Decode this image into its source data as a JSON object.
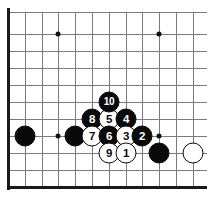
{
  "diagram": {
    "kind": "go-board-diagram",
    "caption": "",
    "board": {
      "edge_sides": [
        "left",
        "bottom"
      ],
      "columns": 12,
      "rows": 11,
      "line_color": "#7a7a7a",
      "edge_color": "#1a1a1a",
      "background_color": "#ffffff",
      "spacing_px": 16.8,
      "origin_x_px": 8,
      "origin_y_px": 12,
      "vertical_lines_x": [
        8,
        25,
        42,
        58,
        75,
        92,
        109,
        126,
        142,
        159,
        176,
        193
      ],
      "horizontal_lines_y": [
        12,
        34,
        51,
        68,
        85,
        102,
        119,
        136,
        153,
        170,
        187
      ],
      "star_points": [
        {
          "name": "star-point-upper-left",
          "x": 58,
          "y": 34
        },
        {
          "name": "star-point-upper-right",
          "x": 159,
          "y": 34
        },
        {
          "name": "star-point-lower-left",
          "x": 58,
          "y": 136
        },
        {
          "name": "star-point-lower-right",
          "x": 159,
          "y": 136
        }
      ]
    },
    "stones": [
      {
        "name": "stone-black-a",
        "color": "black",
        "label": "",
        "x": 25,
        "y": 136
      },
      {
        "name": "stone-black-b",
        "color": "black",
        "label": "",
        "x": 75,
        "y": 136
      },
      {
        "name": "stone-black-c",
        "color": "black",
        "label": "",
        "x": 159,
        "y": 153
      },
      {
        "name": "stone-white-a",
        "color": "white",
        "label": "",
        "x": 193,
        "y": 153
      },
      {
        "name": "stone-move-8",
        "color": "black",
        "label": "8",
        "x": 92,
        "y": 119
      },
      {
        "name": "stone-move-5",
        "color": "white",
        "label": "5",
        "x": 109,
        "y": 119
      },
      {
        "name": "stone-move-4",
        "color": "black",
        "label": "4",
        "x": 126,
        "y": 119
      },
      {
        "name": "stone-move-10",
        "color": "black",
        "label": "10",
        "x": 109,
        "y": 102
      },
      {
        "name": "stone-move-7",
        "color": "white",
        "label": "7",
        "x": 92,
        "y": 136
      },
      {
        "name": "stone-move-6",
        "color": "black",
        "label": "6",
        "x": 109,
        "y": 136
      },
      {
        "name": "stone-move-3",
        "color": "white",
        "label": "3",
        "x": 126,
        "y": 136
      },
      {
        "name": "stone-move-2",
        "color": "black",
        "label": "2",
        "x": 142,
        "y": 136
      },
      {
        "name": "stone-move-9",
        "color": "white",
        "label": "9",
        "x": 109,
        "y": 153
      },
      {
        "name": "stone-move-1",
        "color": "white",
        "label": "1",
        "x": 126,
        "y": 153
      }
    ]
  }
}
